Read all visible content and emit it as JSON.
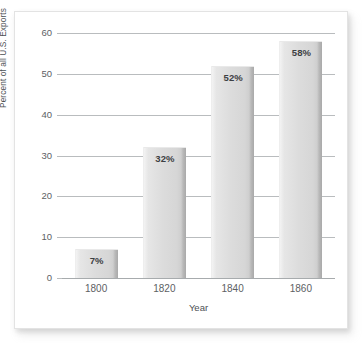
{
  "chart_data": {
    "type": "bar",
    "title": "",
    "subtitle": "",
    "xlabel": "Year",
    "ylabel": "Percent of all U.S. Exports",
    "categories": [
      "1800",
      "1820",
      "1840",
      "1860"
    ],
    "values": [
      7,
      32,
      52,
      58
    ],
    "data_labels": [
      "7%",
      "32%",
      "52%",
      "58%"
    ],
    "ylim": [
      0,
      60
    ],
    "ytick_labels": [
      "0",
      "10",
      "20",
      "30",
      "40",
      "50",
      "60"
    ],
    "ytick_values": [
      0,
      10,
      20,
      30,
      40,
      50,
      60
    ],
    "grid": "horizontal",
    "legend": "none",
    "series": [
      {
        "name": "Percent of all U.S. Exports",
        "values": [
          7,
          32,
          52,
          58
        ]
      }
    ],
    "bar_color": "#d9d9d9",
    "bar_edge_color": "#a9a9a9",
    "gridline_color": "#b9bcbe",
    "label_color": "#3c4043",
    "axis_text_color": "#5d6164"
  }
}
